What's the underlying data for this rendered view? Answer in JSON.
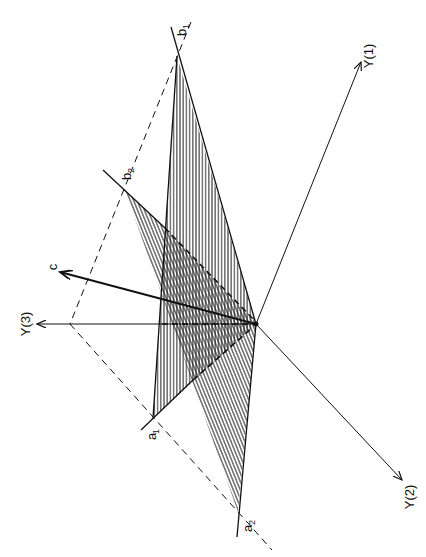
{
  "figure": {
    "type": "3d-geometry-diagram",
    "orientation": "rotated 90deg clockwise (labels read bottom-to-top)",
    "colors": {
      "ink": "#111111",
      "hatch": "#222222",
      "background": "#ffffff"
    }
  },
  "axes": [
    {
      "id": "Y1",
      "label": "Y(1)",
      "from": [
        256,
        324
      ],
      "to": [
        361,
        62
      ]
    },
    {
      "id": "Y2",
      "label": "Y(2)",
      "from": [
        256,
        324
      ],
      "to": [
        402,
        480
      ]
    },
    {
      "id": "Y3",
      "label": "Y(3)",
      "from": [
        256,
        324
      ],
      "to": [
        37,
        324
      ]
    }
  ],
  "vector_c": {
    "label": "c",
    "from": [
      256,
      324
    ],
    "to": [
      60,
      272
    ]
  },
  "points": {
    "origin": [
      256,
      324
    ],
    "b1": {
      "label": "b",
      "sub": "1",
      "pos": [
        177,
        56
      ]
    },
    "b2": {
      "label": "b",
      "sub": "2",
      "pos": [
        125,
        190
      ]
    },
    "a1": {
      "label": "a",
      "sub": "1",
      "pos": [
        153,
        418
      ]
    },
    "a2": {
      "label": "a",
      "sub": "2",
      "pos": [
        238,
        512
      ]
    },
    "corner": [
      70,
      324
    ]
  },
  "planes": [
    {
      "name": "plane-1",
      "hatch": "vertical",
      "vertices": [
        "b1",
        "origin",
        "a1"
      ]
    },
    {
      "name": "plane-2",
      "hatch": "diagonal",
      "vertices": [
        "b2",
        "origin",
        "a2"
      ]
    }
  ],
  "labels": {
    "y1": "Y(1)",
    "y2": "Y(2)",
    "y3": "Y(3)",
    "c": "c",
    "b1_main": "b",
    "b1_sub": "1",
    "b2_main": "b",
    "b2_sub": "2",
    "a1_main": "a",
    "a1_sub": "1",
    "a2_main": "a",
    "a2_sub": "2"
  }
}
